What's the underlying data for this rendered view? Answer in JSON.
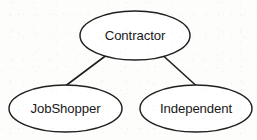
{
  "diagram": {
    "type": "generalization-hierarchy",
    "background_color": "#fdfdfc",
    "stroke_color": "#201e1e",
    "text_color": "#1a1818",
    "nodes": [
      {
        "id": "contractor",
        "label": "Contractor",
        "role": "parent",
        "shape": "ellipse",
        "cx": 135,
        "cy": 35.5,
        "rx": 55,
        "ry": 24.5
      },
      {
        "id": "jobshopper",
        "label": "JobShopper",
        "role": "child",
        "shape": "ellipse",
        "cx": 65.5,
        "cy": 108.5,
        "rx": 56.5,
        "ry": 23.5
      },
      {
        "id": "independent",
        "label": "Independent",
        "role": "child",
        "shape": "ellipse",
        "cx": 196,
        "cy": 108.5,
        "rx": 56,
        "ry": 23.5
      }
    ],
    "edges": [
      {
        "id": "contractor-to-jobshopper",
        "from": "contractor",
        "to": "jobshopper",
        "style": "solid-line",
        "x1": 106,
        "y1": 55.5,
        "x2": 66,
        "y2": 85.5
      },
      {
        "id": "contractor-to-independent",
        "from": "contractor",
        "to": "independent",
        "style": "solid-line",
        "x1": 163,
        "y1": 55.5,
        "x2": 196,
        "y2": 85.5
      }
    ]
  }
}
